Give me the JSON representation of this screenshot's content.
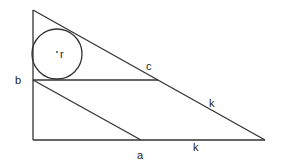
{
  "diagram": {
    "labels": {
      "b": "b",
      "c": "c",
      "k_hyp": "k",
      "k_base": "k",
      "a": "a",
      "r": "r",
      "center_dot": "•"
    },
    "colors": {
      "stroke": "#333333",
      "text": "#222222",
      "background": "#ffffff"
    }
  }
}
